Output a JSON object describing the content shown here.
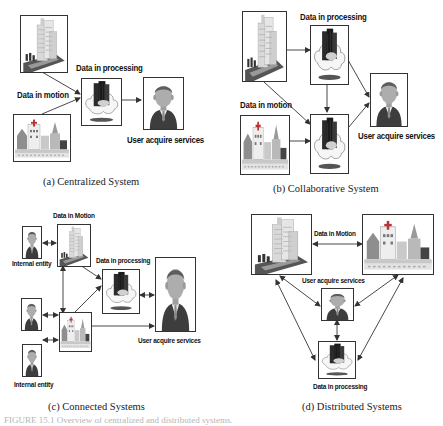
{
  "panels": {
    "a": {
      "caption": "(a) Centralized System",
      "labels": {
        "processing": "Data in processing",
        "motion": "Data in motion",
        "user": "User acquire services"
      },
      "nodes": [
        "city-building",
        "town-buildings",
        "cloud-server",
        "user"
      ]
    },
    "b": {
      "caption": "(b) Collaborative System",
      "labels": {
        "processing": "Data in processing",
        "motion": "Data in motion",
        "user": "User acquire services"
      },
      "nodes": [
        "city-building",
        "town-buildings",
        "cloud-server-top",
        "cloud-server-bottom",
        "user"
      ]
    },
    "c": {
      "caption": "(c) Connected Systems",
      "labels": {
        "motion": "Data in Motion",
        "internal_top": "Internal entity",
        "processing": "Data in processing",
        "user": "User acquire services",
        "internal_bottom": "Internal entity"
      },
      "nodes": [
        "internal-entity-1",
        "internal-entity-2",
        "internal-entity-3",
        "city-building",
        "town-buildings",
        "cloud-server",
        "user-large"
      ]
    },
    "d": {
      "caption": "(d) Distributed Systems",
      "labels": {
        "motion": "Data in Motion",
        "user": "User acquire services",
        "processing": "Data in processing"
      },
      "nodes": [
        "city-building",
        "town-buildings",
        "user",
        "cloud-server"
      ]
    }
  },
  "figure_caption": "FIGURE 15.1   Overview of centralized and distributed systems.",
  "colors": {
    "border": "#333333",
    "arrow": "#333333",
    "cloud": "#f4f4f4",
    "server": "#2a2a2a",
    "building": "#d8d8d8",
    "user_skin": "#a8a8a8",
    "user_suit": "#3c3c3c"
  }
}
